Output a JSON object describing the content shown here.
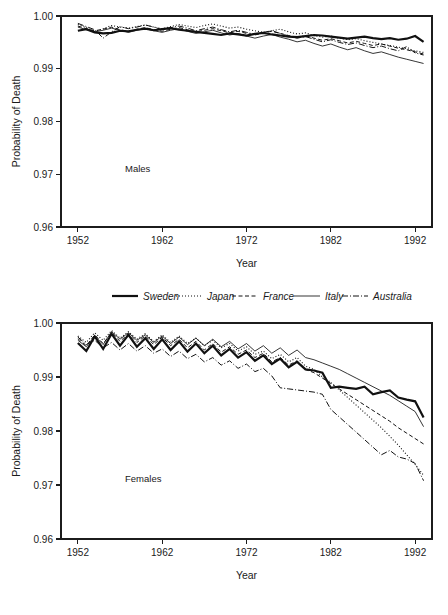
{
  "figure": {
    "caption_fragment": "",
    "panels": [
      "males",
      "females"
    ]
  },
  "legend": {
    "position": "between-panels",
    "entries": [
      {
        "label": "Sweden",
        "style": "thick-solid",
        "dash": "none",
        "width": 2.2
      },
      {
        "label": "Japan",
        "style": "dotted",
        "dash": "1,2",
        "width": 1.1
      },
      {
        "label": "France",
        "style": "dashed",
        "dash": "4,2.5",
        "width": 1.0
      },
      {
        "label": "Italy",
        "style": "thin-solid",
        "dash": "none",
        "width": 0.85
      },
      {
        "label": "Australia",
        "style": "dash-dot",
        "dash": "6,2,1,2",
        "width": 1.0
      }
    ]
  },
  "chart_data": [
    {
      "id": "males",
      "type": "line",
      "title": "",
      "panel_label": "Males",
      "xlabel": "Year",
      "ylabel": "Probability of Death",
      "xlim": [
        1950,
        1994
      ],
      "ylim": [
        0.96,
        1.0
      ],
      "xticks": [
        1952,
        1962,
        1972,
        1982,
        1992
      ],
      "yticks": [
        0.96,
        0.97,
        0.98,
        0.99,
        1.0
      ],
      "ytick_labels": [
        "0.96",
        "0.97",
        "0.98",
        "0.99",
        "1.00"
      ],
      "grid": false,
      "x": [
        1952,
        1953,
        1954,
        1955,
        1956,
        1957,
        1958,
        1959,
        1960,
        1961,
        1962,
        1963,
        1964,
        1965,
        1966,
        1967,
        1968,
        1969,
        1970,
        1971,
        1972,
        1973,
        1974,
        1975,
        1976,
        1977,
        1978,
        1979,
        1980,
        1981,
        1982,
        1983,
        1984,
        1985,
        1986,
        1987,
        1988,
        1989,
        1990,
        1991,
        1992,
        1993
      ],
      "series": [
        {
          "name": "Sweden",
          "values": [
            0.9972,
            0.9975,
            0.9969,
            0.9967,
            0.9968,
            0.9972,
            0.9971,
            0.9974,
            0.9976,
            0.9973,
            0.9975,
            0.9977,
            0.9974,
            0.9972,
            0.997,
            0.9968,
            0.9966,
            0.9964,
            0.9967,
            0.9965,
            0.9963,
            0.9966,
            0.9968,
            0.9965,
            0.9963,
            0.9961,
            0.996,
            0.9962,
            0.9964,
            0.9963,
            0.9961,
            0.9959,
            0.9957,
            0.9959,
            0.9961,
            0.9958,
            0.9956,
            0.9958,
            0.9955,
            0.9957,
            0.9962,
            0.9951
          ]
        },
        {
          "name": "Japan",
          "values": [
            0.9984,
            0.9978,
            0.997,
            0.9976,
            0.9982,
            0.9979,
            0.9977,
            0.998,
            0.9983,
            0.9979,
            0.9976,
            0.998,
            0.9984,
            0.9981,
            0.9978,
            0.9982,
            0.9985,
            0.9981,
            0.9977,
            0.9979,
            0.9975,
            0.9972,
            0.9969,
            0.9972,
            0.9975,
            0.997,
            0.9966,
            0.9968,
            0.9963,
            0.996,
            0.9962,
            0.9958,
            0.9955,
            0.9957,
            0.9953,
            0.995,
            0.9947,
            0.9944,
            0.9941,
            0.9938,
            0.9934,
            0.9931
          ]
        },
        {
          "name": "France",
          "values": [
            0.9981,
            0.9976,
            0.9972,
            0.9975,
            0.9979,
            0.9974,
            0.9971,
            0.9975,
            0.9978,
            0.9974,
            0.9971,
            0.9975,
            0.9978,
            0.9974,
            0.997,
            0.9973,
            0.9976,
            0.9972,
            0.9968,
            0.9971,
            0.9967,
            0.9964,
            0.9968,
            0.9971,
            0.9967,
            0.9963,
            0.9959,
            0.9963,
            0.9958,
            0.9954,
            0.9957,
            0.9953,
            0.9949,
            0.9952,
            0.9948,
            0.9944,
            0.9947,
            0.9943,
            0.9939,
            0.9936,
            0.9932,
            0.9928
          ]
        },
        {
          "name": "Italy",
          "values": [
            0.9979,
            0.9974,
            0.997,
            0.9973,
            0.9977,
            0.9973,
            0.9969,
            0.9973,
            0.9976,
            0.9972,
            0.9969,
            0.9973,
            0.9976,
            0.9971,
            0.9967,
            0.997,
            0.9973,
            0.9968,
            0.9964,
            0.9967,
            0.9962,
            0.9958,
            0.9962,
            0.9965,
            0.996,
            0.9956,
            0.9951,
            0.9954,
            0.9948,
            0.9943,
            0.9947,
            0.9941,
            0.9936,
            0.994,
            0.9934,
            0.9929,
            0.9932,
            0.9927,
            0.9922,
            0.9918,
            0.9914,
            0.991
          ]
        },
        {
          "name": "Australia",
          "values": [
            0.9986,
            0.998,
            0.9974,
            0.9958,
            0.997,
            0.998,
            0.9976,
            0.9979,
            0.9983,
            0.9979,
            0.9974,
            0.9978,
            0.9981,
            0.9977,
            0.9972,
            0.9976,
            0.9979,
            0.9974,
            0.997,
            0.9973,
            0.9969,
            0.9965,
            0.9969,
            0.9972,
            0.9967,
            0.9962,
            0.9958,
            0.9961,
            0.9956,
            0.9951,
            0.9955,
            0.995,
            0.9946,
            0.9949,
            0.9944,
            0.994,
            0.9943,
            0.9938,
            0.9934,
            0.9942,
            0.993,
            0.9926
          ]
        }
      ]
    },
    {
      "id": "females",
      "type": "line",
      "title": "",
      "panel_label": "Females",
      "xlabel": "Year",
      "ylabel": "Probability of Death",
      "xlim": [
        1950,
        1994
      ],
      "ylim": [
        0.96,
        1.0
      ],
      "xticks": [
        1952,
        1962,
        1972,
        1982,
        1992
      ],
      "yticks": [
        0.96,
        0.97,
        0.98,
        0.99,
        1.0
      ],
      "ytick_labels": [
        "0.96",
        "0.97",
        "0.98",
        "0.99",
        "1.00"
      ],
      "grid": false,
      "x": [
        1952,
        1953,
        1954,
        1955,
        1956,
        1957,
        1958,
        1959,
        1960,
        1961,
        1962,
        1963,
        1964,
        1965,
        1966,
        1967,
        1968,
        1969,
        1970,
        1971,
        1972,
        1973,
        1974,
        1975,
        1976,
        1977,
        1978,
        1979,
        1980,
        1981,
        1982,
        1983,
        1984,
        1985,
        1986,
        1987,
        1988,
        1989,
        1990,
        1991,
        1992,
        1993
      ],
      "series": [
        {
          "name": "Sweden",
          "values": [
            0.9963,
            0.9948,
            0.9975,
            0.9952,
            0.998,
            0.9958,
            0.9978,
            0.9956,
            0.9972,
            0.9952,
            0.997,
            0.995,
            0.9966,
            0.9947,
            0.9962,
            0.9944,
            0.9958,
            0.994,
            0.9952,
            0.9936,
            0.9946,
            0.993,
            0.994,
            0.9924,
            0.9934,
            0.9918,
            0.9928,
            0.9914,
            0.9912,
            0.9908,
            0.988,
            0.9882,
            0.988,
            0.9878,
            0.9882,
            0.9868,
            0.9872,
            0.9875,
            0.9862,
            0.9858,
            0.9855,
            0.9825
          ]
        },
        {
          "name": "Japan",
          "values": [
            0.9976,
            0.9964,
            0.9982,
            0.9968,
            0.9986,
            0.9972,
            0.9984,
            0.997,
            0.998,
            0.9966,
            0.9978,
            0.9964,
            0.9976,
            0.9962,
            0.9972,
            0.9958,
            0.9968,
            0.9954,
            0.9962,
            0.9948,
            0.9956,
            0.9942,
            0.9948,
            0.9934,
            0.9942,
            0.9928,
            0.9936,
            0.992,
            0.9914,
            0.99,
            0.989,
            0.9876,
            0.9862,
            0.9848,
            0.9834,
            0.982,
            0.9806,
            0.979,
            0.9774,
            0.9756,
            0.9738,
            0.9718
          ]
        },
        {
          "name": "France",
          "values": [
            0.9971,
            0.9958,
            0.9978,
            0.9962,
            0.9982,
            0.9966,
            0.998,
            0.9964,
            0.9976,
            0.996,
            0.9974,
            0.9958,
            0.997,
            0.9954,
            0.9966,
            0.995,
            0.9962,
            0.9946,
            0.9956,
            0.9942,
            0.995,
            0.9936,
            0.9944,
            0.9928,
            0.9936,
            0.9922,
            0.993,
            0.9914,
            0.9908,
            0.9898,
            0.9888,
            0.9878,
            0.9868,
            0.9858,
            0.9848,
            0.9838,
            0.9828,
            0.9818,
            0.9806,
            0.9796,
            0.9786,
            0.9776
          ]
        },
        {
          "name": "Italy",
          "values": [
            0.9968,
            0.9956,
            0.9976,
            0.996,
            0.9984,
            0.997,
            0.9982,
            0.9968,
            0.9978,
            0.9964,
            0.9976,
            0.9962,
            0.9974,
            0.996,
            0.9972,
            0.9958,
            0.997,
            0.9956,
            0.9966,
            0.9952,
            0.9962,
            0.9948,
            0.9958,
            0.9944,
            0.9954,
            0.994,
            0.995,
            0.9936,
            0.9932,
            0.9926,
            0.992,
            0.9914,
            0.9906,
            0.9898,
            0.989,
            0.9882,
            0.9874,
            0.9866,
            0.9856,
            0.9846,
            0.9836,
            0.9808
          ]
        },
        {
          "name": "Australia",
          "values": [
            0.9974,
            0.996,
            0.9968,
            0.9954,
            0.9964,
            0.995,
            0.9962,
            0.9948,
            0.9958,
            0.9944,
            0.9952,
            0.9938,
            0.9948,
            0.9934,
            0.9942,
            0.9928,
            0.9936,
            0.9922,
            0.993,
            0.9916,
            0.9924,
            0.991,
            0.9916,
            0.9902,
            0.988,
            0.9878,
            0.9876,
            0.9874,
            0.9872,
            0.9868,
            0.984,
            0.9826,
            0.9812,
            0.9798,
            0.9784,
            0.977,
            0.9756,
            0.9764,
            0.9752,
            0.9748,
            0.974,
            0.9708
          ]
        }
      ]
    }
  ]
}
